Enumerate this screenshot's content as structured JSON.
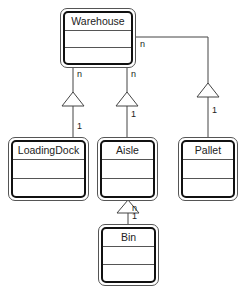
{
  "diagram": {
    "type": "UML class diagram (aggregation)",
    "classes": [
      {
        "id": "warehouse",
        "name": "Warehouse"
      },
      {
        "id": "loadingdock",
        "name": "LoadingDock"
      },
      {
        "id": "aisle",
        "name": "Aisle"
      },
      {
        "id": "pallet",
        "name": "Pallet"
      },
      {
        "id": "bin",
        "name": "Bin"
      }
    ],
    "relationships": [
      {
        "from": "loadingdock",
        "to": "warehouse",
        "whole_mult": "n",
        "part_mult": "1"
      },
      {
        "from": "aisle",
        "to": "warehouse",
        "whole_mult": "n",
        "part_mult": "1"
      },
      {
        "from": "pallet",
        "to": "warehouse",
        "whole_mult": "n",
        "part_mult": "1"
      },
      {
        "from": "bin",
        "to": "aisle",
        "whole_mult": "n",
        "part_mult": "1"
      }
    ]
  }
}
